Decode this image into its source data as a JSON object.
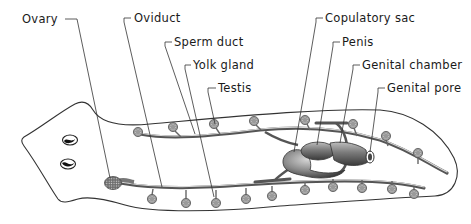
{
  "diagram": {
    "labels": [
      {
        "id": "ovary",
        "text": "Ovary"
      },
      {
        "id": "oviduct",
        "text": "Oviduct"
      },
      {
        "id": "sperm_duct",
        "text": "Sperm duct"
      },
      {
        "id": "yolk_gland",
        "text": "Yolk gland"
      },
      {
        "id": "testis",
        "text": "Testis"
      },
      {
        "id": "copulatory_sac",
        "text": "Copulatory sac"
      },
      {
        "id": "penis",
        "text": "Penis"
      },
      {
        "id": "genital_chamber",
        "text": "Genital chamber"
      },
      {
        "id": "genital_pore",
        "text": "Genital pore"
      }
    ],
    "colors": {
      "outline": "#333333",
      "organ_fill": "#8c8c8c",
      "background": "#ffffff"
    }
  }
}
